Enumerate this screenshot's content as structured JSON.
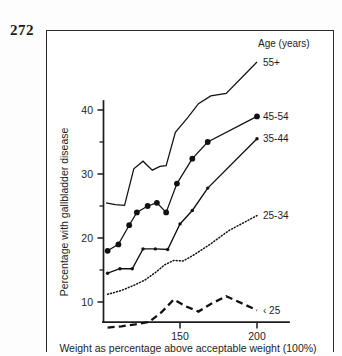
{
  "page": {
    "folio": "272"
  },
  "chart_data": {
    "type": "line",
    "title": "",
    "xlabel": "Weight as percentage above acceptable weight (100%)",
    "ylabel": "Percentage with gallbladder disease",
    "legend_title": "Age (years)",
    "legend_position": "right",
    "grid": false,
    "xlim": [
      100,
      210
    ],
    "ylim": [
      5,
      49
    ],
    "xticks": [
      150,
      200
    ],
    "xticklabels": [
      "150",
      "200"
    ],
    "yticks": [
      10,
      20,
      30,
      40
    ],
    "yticklabels": [
      "10",
      "20",
      "30",
      "40"
    ],
    "yticks_minor": [
      15,
      25,
      35,
      45
    ],
    "series": [
      {
        "name": "55+",
        "label": "55+",
        "style": "solid",
        "marker": "none",
        "color": "#111111",
        "x": [
          102,
          108,
          114,
          120,
          126,
          132,
          137,
          141,
          147,
          155,
          162,
          170,
          180,
          200
        ],
        "y": [
          25.5,
          25.2,
          25.1,
          30.8,
          32.0,
          30.6,
          31.2,
          31.3,
          36.5,
          38.8,
          41.0,
          42.2,
          42.6,
          47.5
        ]
      },
      {
        "name": "45-54",
        "label": "45-54",
        "style": "solid",
        "marker": "circle-large",
        "color": "#111111",
        "x": [
          103,
          110,
          117,
          122,
          129,
          135,
          141,
          148,
          158,
          168,
          200
        ],
        "y": [
          18.0,
          19.0,
          22.0,
          24.0,
          25.0,
          25.5,
          24.0,
          28.5,
          32.4,
          35.0,
          39.0
        ]
      },
      {
        "name": "35-44",
        "label": "35-44",
        "style": "dash-dot",
        "marker": "circle-small",
        "color": "#111111",
        "x": [
          103,
          111,
          119,
          126,
          134,
          142,
          150,
          158,
          168,
          200
        ],
        "y": [
          14.5,
          15.2,
          15.2,
          18.3,
          18.3,
          18.2,
          22.2,
          24.3,
          27.8,
          35.5
        ]
      },
      {
        "name": "25-34",
        "label": "25-34",
        "style": "dotted",
        "marker": "none",
        "color": "#111111",
        "x": [
          103,
          112,
          120,
          127,
          134,
          140,
          146,
          152,
          160,
          170,
          182,
          200
        ],
        "y": [
          11.2,
          11.8,
          12.6,
          13.4,
          14.6,
          15.8,
          16.5,
          16.4,
          17.5,
          19.1,
          21.2,
          23.5
        ]
      },
      {
        "name": "< 25",
        "label": "‹ 25",
        "style": "dashed",
        "marker": "none",
        "color": "#111111",
        "x": [
          103,
          112,
          121,
          130,
          138,
          146,
          154,
          162,
          170,
          180,
          192,
          200
        ],
        "y": [
          6.0,
          6.2,
          6.5,
          6.9,
          8.4,
          10.4,
          9.3,
          8.5,
          9.7,
          10.9,
          9.6,
          8.7
        ]
      }
    ],
    "legend_entries": [
      {
        "label": "55+",
        "y_value": 47.5
      },
      {
        "label": "45-54",
        "y_value": 39.0
      },
      {
        "label": "35-44",
        "y_value": 35.5
      },
      {
        "label": "25-34",
        "y_value": 23.5
      },
      {
        "label": "‹ 25",
        "y_value": 8.7
      }
    ]
  }
}
